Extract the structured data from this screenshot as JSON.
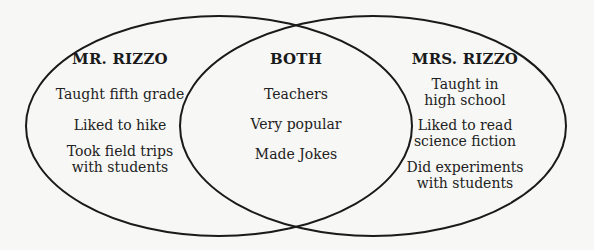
{
  "diagram": {
    "type": "venn",
    "stroke_color": "#1a1a1a",
    "background_color": "#f7f7f5",
    "left": {
      "title": "MR. RIZZO",
      "items": [
        "Taught fifth grade",
        "Liked to hike",
        "Took field trips\nwith students"
      ]
    },
    "both": {
      "title": "BOTH",
      "items": [
        "Teachers",
        "Very popular",
        "Made Jokes"
      ]
    },
    "right": {
      "title": "MRS. RIZZO",
      "items": [
        "Taught in\nhigh school",
        "Liked to read\nscience fiction",
        "Did experiments\nwith students"
      ]
    }
  }
}
